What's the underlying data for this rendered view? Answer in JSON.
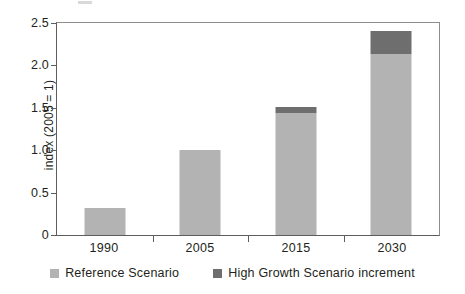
{
  "chart_data": {
    "type": "bar",
    "stacked": true,
    "title": "",
    "subtitle": "",
    "xlabel": "",
    "ylabel": "index (2005 = 1)",
    "categories": [
      "1990",
      "2005",
      "2015",
      "2030"
    ],
    "series": [
      {
        "name": "Reference Scenario",
        "color": "#b3b3b3",
        "values": [
          0.32,
          1.0,
          1.44,
          2.13
        ]
      },
      {
        "name": "High Growth Scenario increment",
        "color": "#6e6e6e",
        "values": [
          0,
          0,
          0.07,
          0.28
        ]
      }
    ],
    "totals": [
      0.32,
      1.0,
      1.51,
      2.41
    ],
    "ylim": [
      0,
      2.5
    ],
    "yticks": [
      0,
      0.5,
      1.0,
      1.5,
      2.0,
      2.5
    ],
    "ytick_labels": [
      "0",
      "0.5",
      "1.0",
      "1.5",
      "2.0",
      "2.5"
    ],
    "grid": false,
    "legend_position": "bottom",
    "axis_color": "#5d5d5d",
    "frame_color": "#8d8d8d",
    "background": "#ffffff"
  },
  "legend": {
    "items": [
      {
        "label": "Reference Scenario",
        "color": "#b3b3b3"
      },
      {
        "label": "High Growth Scenario increment",
        "color": "#6e6e6e"
      }
    ]
  }
}
